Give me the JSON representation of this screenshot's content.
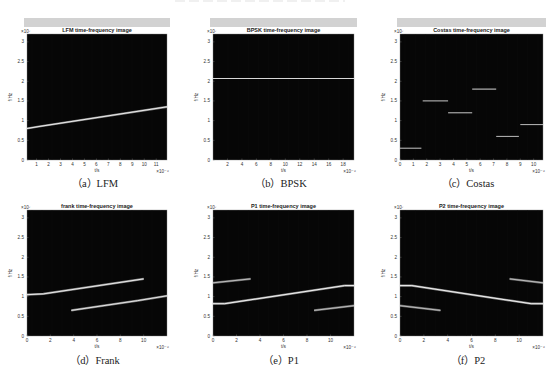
{
  "chart_data": [
    {
      "id": "a",
      "type": "heatmap",
      "title": "LFM time-frequency image",
      "caption": "（a）LFM",
      "xlabel": "t/s",
      "ylabel": "f/Hz",
      "x_exponent": "×10⁻⁶",
      "y_exponent": "×10⁷",
      "xlim": [
        0.2,
        11.9
      ],
      "ylim": [
        0,
        3.2
      ],
      "xticks": [
        1,
        2,
        3,
        4,
        5,
        6,
        7,
        8,
        9,
        10,
        11
      ],
      "yticks": [
        0,
        0.5,
        1,
        1.5,
        2,
        2.5,
        3
      ],
      "has_greybar": true,
      "ridges": [
        {
          "points": [
            [
              0.2,
              0.8
            ],
            [
              1.2,
              0.85
            ],
            [
              11.9,
              1.35
            ]
          ],
          "intensity": 0.85
        }
      ]
    },
    {
      "id": "b",
      "type": "heatmap",
      "title": "BPSK time-frequency image",
      "caption": "（b）BPSK",
      "xlabel": "t/s",
      "ylabel": "f/Hz",
      "x_exponent": "×10⁻⁶",
      "y_exponent": "×10⁷",
      "xlim": [
        0,
        19.5
      ],
      "ylim": [
        0,
        3.2
      ],
      "xticks": [
        2,
        4,
        6,
        8,
        10,
        12,
        14,
        16,
        18
      ],
      "yticks": [
        0,
        0.5,
        1,
        1.5,
        2,
        2.5,
        3
      ],
      "has_greybar": true,
      "ridges": [
        {
          "points": [
            [
              0,
              2.07
            ],
            [
              19.5,
              2.07
            ]
          ],
          "intensity": 0.7
        }
      ]
    },
    {
      "id": "c",
      "type": "heatmap",
      "title": "Costas time-frequency image",
      "caption": "（c）Costas",
      "xlabel": "t/s",
      "ylabel": "f/Hz",
      "x_exponent": "×10⁻⁶",
      "y_exponent": "×10⁷",
      "xlim": [
        0,
        10.7
      ],
      "ylim": [
        0,
        3.2
      ],
      "xticks": [
        0,
        1,
        2,
        3,
        4,
        5,
        6,
        7,
        8,
        9,
        10
      ],
      "yticks": [
        0,
        0.5,
        1,
        1.5,
        2,
        2.5,
        3
      ],
      "has_greybar": true,
      "ridges": [
        {
          "points": [
            [
              0,
              0.3
            ],
            [
              1.6,
              0.3
            ]
          ],
          "intensity": 0.6
        },
        {
          "points": [
            [
              1.7,
              1.5
            ],
            [
              3.6,
              1.5
            ]
          ],
          "intensity": 0.6
        },
        {
          "points": [
            [
              3.6,
              1.2
            ],
            [
              5.4,
              1.2
            ]
          ],
          "intensity": 0.6
        },
        {
          "points": [
            [
              5.4,
              1.8
            ],
            [
              7.2,
              1.8
            ]
          ],
          "intensity": 0.7
        },
        {
          "points": [
            [
              7.2,
              0.6
            ],
            [
              8.9,
              0.6
            ]
          ],
          "intensity": 0.5
        },
        {
          "points": [
            [
              9.0,
              0.9
            ],
            [
              10.7,
              0.9
            ]
          ],
          "intensity": 0.5
        }
      ]
    },
    {
      "id": "d",
      "type": "heatmap",
      "title": "frank time-frequency image",
      "caption": "（d）Frank",
      "xlabel": "t/s",
      "ylabel": "f/Hz",
      "x_exponent": "×10⁻⁶",
      "y_exponent": "×10⁷",
      "xlim": [
        0,
        12
      ],
      "ylim": [
        0,
        3.2
      ],
      "xticks": [
        0,
        2,
        4,
        6,
        8,
        10
      ],
      "yticks": [
        0,
        0.5,
        1,
        1.5,
        2,
        2.5,
        3
      ],
      "has_greybar": false,
      "ridges": [
        {
          "points": [
            [
              0,
              1.05
            ],
            [
              1.4,
              1.07
            ],
            [
              10,
              1.45
            ]
          ],
          "intensity": 0.85
        },
        {
          "points": [
            [
              3.8,
              0.65
            ],
            [
              9.5,
              0.9
            ],
            [
              12,
              1.02
            ]
          ],
          "intensity": 0.8
        }
      ]
    },
    {
      "id": "e",
      "type": "heatmap",
      "title": "P1 time-frequency image",
      "caption": "（e）P1",
      "xlabel": "t/s",
      "ylabel": "f/Hz",
      "x_exponent": "×10⁻⁶",
      "y_exponent": "×10⁷",
      "xlim": [
        0,
        12
      ],
      "ylim": [
        0,
        3.2
      ],
      "xticks": [
        0,
        2,
        4,
        6,
        8,
        10
      ],
      "yticks": [
        0,
        0.5,
        1,
        1.5,
        2,
        2.5,
        3
      ],
      "has_greybar": false,
      "ridges": [
        {
          "points": [
            [
              0,
              0.82
            ],
            [
              1.0,
              0.82
            ],
            [
              11.2,
              1.28
            ],
            [
              12,
              1.28
            ]
          ],
          "intensity": 0.9
        },
        {
          "points": [
            [
              0,
              1.35
            ],
            [
              3.2,
              1.45
            ]
          ],
          "intensity": 0.5
        },
        {
          "points": [
            [
              8.6,
              0.65
            ],
            [
              12,
              0.77
            ]
          ],
          "intensity": 0.5
        }
      ]
    },
    {
      "id": "f",
      "type": "heatmap",
      "title": "P2 time-frequency image",
      "caption": "（f）P2",
      "xlabel": "t/s",
      "ylabel": "f/Hz",
      "x_exponent": "×10⁻⁶",
      "y_exponent": "×10⁷",
      "xlim": [
        0,
        12
      ],
      "ylim": [
        0,
        3.2
      ],
      "xticks": [
        0,
        2,
        4,
        6,
        8,
        10
      ],
      "yticks": [
        0,
        0.5,
        1,
        1.5,
        2,
        2.5,
        3
      ],
      "has_greybar": false,
      "ridges": [
        {
          "points": [
            [
              0,
              1.28
            ],
            [
              1.0,
              1.28
            ],
            [
              11,
              0.82
            ],
            [
              12,
              0.82
            ]
          ],
          "intensity": 0.9
        },
        {
          "points": [
            [
              0,
              0.77
            ],
            [
              3.4,
              0.65
            ]
          ],
          "intensity": 0.5
        },
        {
          "points": [
            [
              9.2,
              1.45
            ],
            [
              12,
              1.35
            ]
          ],
          "intensity": 0.5
        }
      ]
    }
  ]
}
